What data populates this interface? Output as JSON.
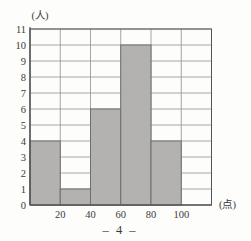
{
  "page": {
    "footer": "– 4 –"
  },
  "chart_data": {
    "type": "bar",
    "subtype": "histogram",
    "title": "",
    "y_unit": "(人)",
    "x_unit": "(点)",
    "xlim": [
      0,
      120
    ],
    "ylim": [
      0,
      11
    ],
    "x_ticks": [
      20,
      40,
      60,
      80,
      100
    ],
    "x_gridlines": [
      0,
      20,
      40,
      60,
      80,
      100,
      120
    ],
    "y_ticks": [
      0,
      1,
      2,
      3,
      4,
      5,
      6,
      7,
      8,
      9,
      10,
      11
    ],
    "bins": [
      {
        "from": 0,
        "to": 20,
        "count": 4
      },
      {
        "from": 20,
        "to": 40,
        "count": 1
      },
      {
        "from": 40,
        "to": 60,
        "count": 6
      },
      {
        "from": 60,
        "to": 80,
        "count": 10
      },
      {
        "from": 80,
        "to": 100,
        "count": 4
      }
    ],
    "grid": true,
    "legend": false,
    "colors": {
      "bar_fill": "#b3b2b0",
      "bar_border": "#6e6e6e",
      "grid": "#8f8f8f",
      "axis": "#555555",
      "text": "#3a3a3a"
    }
  }
}
